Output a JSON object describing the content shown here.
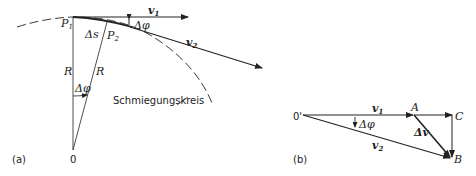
{
  "figure_a": {
    "tag": "(a)",
    "points": {
      "p1": "P",
      "p1_sub": "1",
      "p2": "P",
      "p2_sub": "2",
      "origin": "0"
    },
    "labels": {
      "delta_s": "Δs",
      "delta_phi_top": "Δφ",
      "delta_phi_center": "Δφ",
      "radius_1": "R",
      "radius_2": "R",
      "v1": "v",
      "v1_sub": "1",
      "v2": "v",
      "v2_sub": "2",
      "osculating_circle": "Schmiegungskreis"
    }
  },
  "figure_b": {
    "tag": "(b)",
    "points": {
      "origin": "0'",
      "a": "A",
      "b": "B",
      "c": "C"
    },
    "labels": {
      "v1": "v",
      "v1_sub": "1",
      "v2": "v",
      "v2_sub": "2",
      "delta_phi": "Δφ",
      "delta_v": "Δv"
    }
  }
}
